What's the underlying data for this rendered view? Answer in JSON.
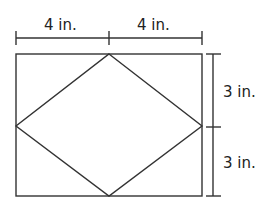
{
  "diagram": {
    "top_dimensions": [
      {
        "label": "4 in."
      },
      {
        "label": "4 in."
      }
    ],
    "right_dimensions": [
      {
        "label": "3 in."
      },
      {
        "label": "3 in."
      }
    ],
    "stroke_color": "#333333"
  }
}
